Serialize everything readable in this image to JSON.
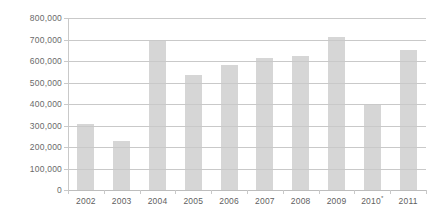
{
  "chart_data": {
    "type": "bar",
    "title": "",
    "subtitle": "",
    "xlabel": "",
    "ylabel": "",
    "categories": [
      "2002",
      "2003",
      "2004",
      "2005",
      "2006",
      "2007",
      "2008",
      "2009",
      "2010*",
      "2011"
    ],
    "category_notes": [
      "",
      "",
      "",
      "",
      "",
      "",
      "",
      "",
      "*",
      ""
    ],
    "values": [
      305000,
      230000,
      698000,
      535000,
      583000,
      612000,
      625000,
      710000,
      395000,
      652000
    ],
    "series": [
      {
        "name": "Value",
        "values": [
          305000,
          230000,
          698000,
          535000,
          583000,
          612000,
          625000,
          710000,
          395000,
          652000
        ]
      }
    ],
    "ylim": [
      0,
      800000
    ],
    "ytick_values": [
      0,
      100000,
      200000,
      300000,
      400000,
      500000,
      600000,
      700000,
      800000
    ],
    "ytick_labels": [
      "0",
      "100,000",
      "200,000",
      "300,000",
      "400,000",
      "500,000",
      "600,000",
      "700,000",
      "800,000"
    ],
    "grid": true,
    "grid_axis": "y",
    "legend": false,
    "legend_position": "none",
    "bar_color": "#d6d6d6",
    "gridline_color": "#c9c9c9",
    "axis_text_color": "#5f5f5f",
    "background_color": "#ffffff",
    "annotations": []
  }
}
